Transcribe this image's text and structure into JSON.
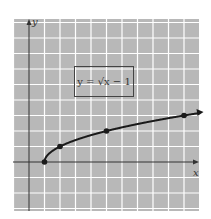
{
  "chart_data": {
    "type": "line",
    "title": "",
    "equation_label": "y = √x − 1",
    "xlabel": "x",
    "ylabel": "y",
    "grid": true,
    "legend_position": "none",
    "xlim": [
      -1,
      11
    ],
    "ylim": [
      -3,
      9
    ],
    "series": [
      {
        "name": "y = sqrt(x - 1)",
        "function": "sqrt(x-1)",
        "x": [
          1,
          2,
          5,
          10
        ],
        "y": [
          0,
          1,
          2,
          3
        ],
        "marked_points": [
          [
            1,
            0
          ],
          [
            2,
            1
          ],
          [
            5,
            2
          ],
          [
            10,
            3
          ]
        ],
        "arrow_at_end": true
      }
    ]
  },
  "colors": {
    "background": "#b8b8b8",
    "gridline": "#ffffff",
    "axis": "#333333",
    "curve": "#1a1a1a"
  }
}
